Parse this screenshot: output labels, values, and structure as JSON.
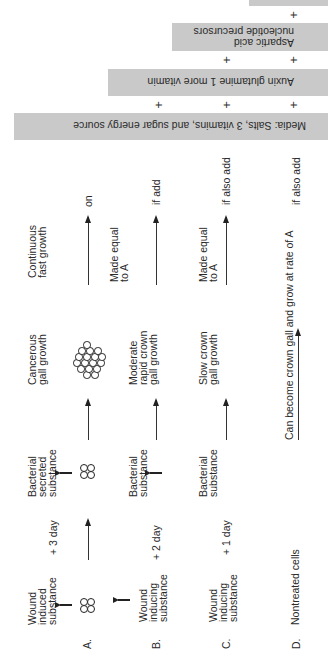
{
  "orientation": "rotated -90 degrees (reads bottom-to-top)",
  "supplements": {
    "boxes": [
      {
        "id": "media",
        "label": "Media: Salts, 3 vitamins, and sugar energy source"
      },
      {
        "id": "auxin",
        "label": "Auxin glutamine 1 more vitamin"
      },
      {
        "id": "aspartic",
        "label_line1": "Aspartic acid",
        "label_line2": "nucleotide precursors"
      },
      {
        "id": "top-partial",
        "label": ""
      }
    ],
    "plus_sign": "+"
  },
  "rows": [
    {
      "letter": "A.",
      "col1": [
        "Wound",
        "induced",
        "substance"
      ],
      "interval": "+ 3 day",
      "col2": [
        "Bacterial",
        "secreted",
        "substance"
      ],
      "col3": [
        "Cancerous",
        "gall growth"
      ],
      "col4": [
        "Continuous",
        "fast growth"
      ],
      "condition": "on"
    },
    {
      "letter": "B.",
      "col1": [
        "Wound",
        "inducing",
        "substance"
      ],
      "interval": "+ 2 day",
      "col2": [
        "Bacterial",
        "substance"
      ],
      "col3": [
        "Moderate",
        "rapid crown",
        "gall growth"
      ],
      "col4": [
        "Made equal",
        "to A"
      ],
      "condition": "if add"
    },
    {
      "letter": "C.",
      "col1": [
        "Wound",
        "inducing",
        "substance"
      ],
      "interval": "+ 1 day",
      "col2": [
        "Bacterial",
        "substance"
      ],
      "col3": [
        "Slow crown",
        "gall growth"
      ],
      "col4": [
        "Made equal",
        "to A"
      ],
      "condition": "if also add"
    },
    {
      "letter": "D.",
      "col1": [
        "Nontreated cells"
      ],
      "span_text": "Can become crown gall and grow at rate of A",
      "condition": "if also add"
    }
  ],
  "colors": {
    "box_fill": "#c9c9c9",
    "text": "#2a2a2a",
    "background": "#ffffff"
  }
}
